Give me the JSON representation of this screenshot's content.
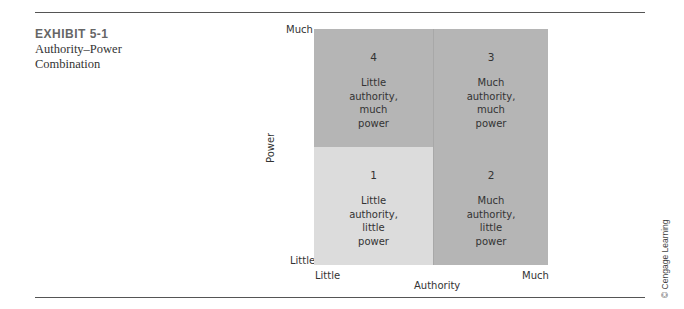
{
  "exhibit": {
    "label": "EXHIBIT 5-1",
    "title_line1": "Authority–Power",
    "title_line2": "Combination"
  },
  "axes": {
    "y_title": "Power",
    "y_high": "Much",
    "y_low": "Little",
    "x_title": "Authority",
    "x_low": "Little",
    "x_high": "Much"
  },
  "quadrants": [
    {
      "number": "1",
      "lines": [
        "Little",
        "authority,",
        "little",
        "power"
      ],
      "color": "#dcdcdc",
      "position": "bottom-left"
    },
    {
      "number": "2",
      "lines": [
        "Much",
        "authority,",
        "little",
        "power"
      ],
      "color": "#b5b5b5",
      "position": "bottom-right"
    },
    {
      "number": "3",
      "lines": [
        "Much",
        "authority,",
        "much",
        "power"
      ],
      "color": "#b5b5b5",
      "position": "top-right"
    },
    {
      "number": "4",
      "lines": [
        "Little",
        "authority,",
        "much",
        "power"
      ],
      "color": "#b5b5b5",
      "position": "top-left"
    }
  ],
  "credit": "© Cengage Learning"
}
